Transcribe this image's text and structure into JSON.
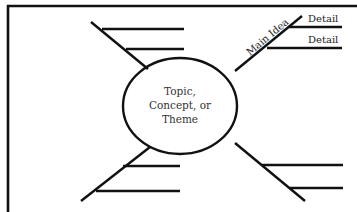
{
  "diagram": {
    "type": "concept-map",
    "center": {
      "lines": [
        "Topic,",
        "Concept, or",
        "Theme"
      ]
    },
    "branches": [
      {
        "position": "top-right",
        "label": "Main Idea",
        "details": [
          "Detail",
          "Detail"
        ]
      },
      {
        "position": "top-left",
        "label": "",
        "details": [
          "",
          ""
        ]
      },
      {
        "position": "bottom-left",
        "label": "",
        "details": [
          "",
          ""
        ]
      },
      {
        "position": "bottom-right",
        "label": "",
        "details": [
          "",
          ""
        ]
      }
    ],
    "colors": {
      "line": "#111111",
      "text": "#333333",
      "background": "#ffffff"
    }
  }
}
